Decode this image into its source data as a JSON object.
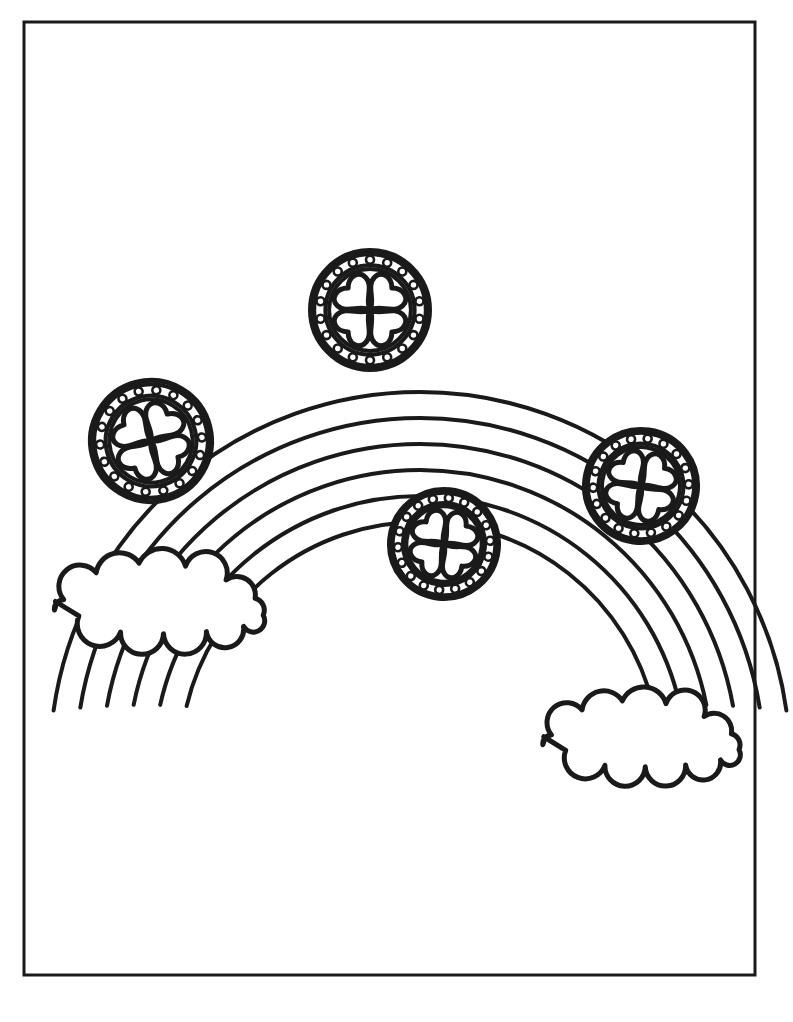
{
  "page": {
    "title": "Rainbow With Clover Coins Coloring Page",
    "width": 793,
    "height": 1022,
    "background_color": "#ffffff",
    "ink_color": "#1a1a1a",
    "style": "line-art-coloring-page"
  },
  "border": {
    "name": "page-border-frame",
    "x": 24,
    "y": 22,
    "width": 731,
    "height": 953,
    "stroke_width": 3,
    "color": "#1a1a1a",
    "fill": "none"
  },
  "rainbow": {
    "name": "rainbow-arc",
    "center_x": 420,
    "center_y": 762,
    "band_count": 5,
    "arc_line_count": 6,
    "outer_radius": 370,
    "band_thickness": 26,
    "stroke_width": 4,
    "start_angle_deg": 188,
    "end_angle_deg": 352,
    "color": "#1a1a1a"
  },
  "clouds": [
    {
      "name": "cloud-left",
      "center_x": 160,
      "center_y": 590,
      "width": 232,
      "height": 92,
      "stroke_width": 5,
      "color": "#1a1a1a",
      "fill": "#ffffff"
    },
    {
      "name": "cloud-right",
      "center_x": 642,
      "center_y": 726,
      "width": 218,
      "height": 86,
      "stroke_width": 5,
      "color": "#1a1a1a",
      "fill": "#ffffff"
    }
  ],
  "coins": [
    {
      "name": "coin-top",
      "label": "Top clover coin",
      "center_x": 370,
      "center_y": 310,
      "radius": 62,
      "rotation_deg": 0,
      "rivet_count": 18,
      "emblem": "four-leaf-clover"
    },
    {
      "name": "coin-left",
      "label": "Left clover coin",
      "center_x": 151,
      "center_y": 441,
      "radius": 63,
      "rotation_deg": -14,
      "rivet_count": 18,
      "emblem": "four-leaf-clover"
    },
    {
      "name": "coin-center",
      "label": "Center clover coin",
      "center_x": 444,
      "center_y": 544,
      "radius": 57,
      "rotation_deg": 6,
      "rivet_count": 18,
      "emblem": "four-leaf-clover"
    },
    {
      "name": "coin-right",
      "label": "Right clover coin",
      "center_x": 641,
      "center_y": 486,
      "radius": 59,
      "rotation_deg": 8,
      "rivet_count": 18,
      "emblem": "four-leaf-clover"
    }
  ],
  "coin_style": {
    "outer_ring_stroke": 5,
    "rivet_ring_outer_ratio": 0.9,
    "rivet_ring_inner_ratio": 0.72,
    "rivet_ring_stroke": 4,
    "rivet_radius": 4,
    "inner_disc_ratio": 0.66,
    "inner_disc_stroke": 4,
    "clover_stroke": 5,
    "clover_lobe_ratio": 0.26
  }
}
